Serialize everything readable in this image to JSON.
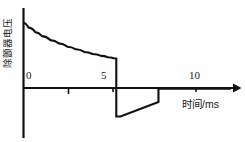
{
  "chart_data": {
    "type": "line",
    "title": "",
    "subtitle": "",
    "xlabel": "时间/ms",
    "ylabel": "除颤器电压",
    "xlim": [
      -0.6,
      12.5
    ],
    "ylim": [
      -0.45,
      1.12
    ],
    "grid": false,
    "legend": null,
    "x_ticks": [
      0,
      5,
      10
    ],
    "x_tick_labels": [
      "0",
      "5",
      "10"
    ],
    "x_minor_ticks": [
      2.5
    ],
    "y_ticks": [],
    "y_tick_labels": [],
    "annotations": [],
    "series": [
      {
        "name": "除颤器电压",
        "color": "#111111",
        "description": "双相波除颤脉冲：0~5.5ms 正相指数衰减，随后陡降至负峰，5.8~8.0ms 负相线性上升回零",
        "x": [
          0.0,
          0.3,
          0.7,
          1.1,
          1.6,
          2.1,
          2.6,
          3.1,
          3.6,
          4.1,
          4.6,
          5.0,
          5.35,
          5.5,
          5.5,
          5.75,
          8.0,
          8.0,
          12.3
        ],
        "y": [
          1.0,
          0.93,
          0.86,
          0.8,
          0.74,
          0.69,
          0.64,
          0.6,
          0.56,
          0.53,
          0.5,
          0.48,
          0.465,
          0.46,
          -0.42,
          -0.42,
          -0.2,
          0.0,
          0.0
        ]
      }
    ]
  },
  "axes": {
    "x_axis_arrow": true,
    "y_axis_arrow": false,
    "origin_label": "0"
  },
  "labels": {
    "x_title": "时间/ms",
    "y_title": "除颤器电压",
    "tick_0": "0",
    "tick_5": "5",
    "tick_10": "10"
  },
  "colors": {
    "stroke": "#111111",
    "background": "#fefefe"
  }
}
